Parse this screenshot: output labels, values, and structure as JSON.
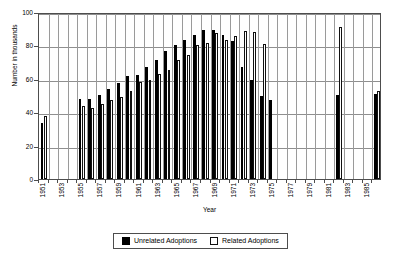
{
  "chart_data": {
    "type": "bar",
    "title": "",
    "xlabel": "Year",
    "ylabel": "Number in thousands",
    "ylim": [
      0,
      100
    ],
    "yticks": [
      0,
      20,
      40,
      60,
      80,
      100
    ],
    "grid": "horizontal-and-vertical",
    "legend_position": "bottom-center",
    "categories": [
      1951,
      1952,
      1953,
      1954,
      1955,
      1956,
      1957,
      1958,
      1959,
      1960,
      1961,
      1962,
      1963,
      1964,
      1965,
      1966,
      1967,
      1968,
      1969,
      1970,
      1971,
      1972,
      1973,
      1974,
      1975,
      1976,
      1977,
      1978,
      1979,
      1980,
      1981,
      1982,
      1983,
      1984,
      1985,
      1986
    ],
    "xtick_labels": [
      "1951",
      "1953",
      "1955",
      "1957",
      "1959",
      "1961",
      "1963",
      "1965",
      "1967",
      "1969",
      "1971",
      "1973",
      "1975",
      "1977",
      "1979",
      "1981",
      "1983",
      "1985"
    ],
    "series": [
      {
        "name": "Unrelated Adoptions",
        "color": "#000000",
        "style": "filled",
        "values": [
          33.5,
          null,
          null,
          null,
          48.0,
          48.0,
          50.5,
          54.0,
          57.5,
          61.5,
          62.5,
          67.0,
          71.0,
          76.5,
          80.5,
          83.5,
          86.5,
          89.0,
          89.0,
          86.0,
          82.5,
          67.0,
          59.0,
          50.0,
          47.5,
          null,
          null,
          null,
          null,
          null,
          null,
          50.5,
          null,
          null,
          null,
          51.0
        ]
      },
      {
        "name": "Related Adoptions",
        "color": "#ffffff",
        "style": "hollow",
        "values": [
          38.0,
          null,
          null,
          null,
          44.0,
          42.5,
          45.0,
          47.5,
          49.0,
          52.5,
          58.0,
          59.5,
          63.0,
          65.5,
          71.0,
          74.0,
          80.0,
          81.5,
          87.5,
          83.0,
          85.5,
          88.5,
          88.0,
          81.0,
          null,
          null,
          null,
          null,
          null,
          null,
          null,
          91.0,
          null,
          null,
          null,
          53.0
        ]
      }
    ]
  },
  "legend": {
    "entries": [
      {
        "label": "Unrelated Adoptions",
        "swatch": "filled-square-icon"
      },
      {
        "label": "Related Adoptions",
        "swatch": "hollow-square-icon"
      }
    ]
  },
  "axes": {
    "y_title": "Number in thousands",
    "x_title": "Year"
  }
}
